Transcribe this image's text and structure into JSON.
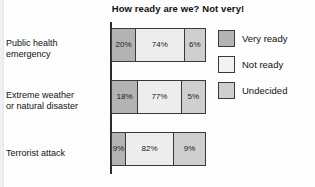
{
  "chart_data": {
    "type": "bar",
    "subtype": "stacked-horizontal-100pct",
    "title": "How ready are we? Not very!",
    "xlabel": "",
    "ylabel": "",
    "xlim": [
      0,
      100
    ],
    "grid": false,
    "legend_position": "right",
    "categories": [
      "Public health emergency",
      "Extreme weather or natural disaster",
      "Terrorist attack"
    ],
    "series": [
      {
        "name": "Very ready",
        "color": "#b3b3b3",
        "values": [
          20,
          74,
          6
        ]
      },
      {
        "name": "Not ready",
        "color": "#f2f2f2",
        "values": [
          18,
          77,
          5
        ]
      },
      {
        "name": "Undecided",
        "color": "#cfcfcf",
        "values": [
          9,
          82,
          9
        ]
      }
    ],
    "rows": [
      {
        "category": "Public health emergency",
        "category_line1": "Public health",
        "category_line2": "emergency",
        "segments": [
          {
            "series": "Very ready",
            "value": 20,
            "label": "20%",
            "width_pct": 26
          },
          {
            "series": "Not ready",
            "value": 74,
            "label": "74%",
            "width_pct": 52
          },
          {
            "series": "Undecided",
            "value": 6,
            "label": "6%",
            "width_pct": 22
          }
        ]
      },
      {
        "category": "Extreme weather or natural disaster",
        "category_line1": "Extreme weather",
        "category_line2": "or natural disaster",
        "segments": [
          {
            "series": "Very ready",
            "value": 18,
            "label": "18%",
            "width_pct": 28
          },
          {
            "series": "Not ready",
            "value": 77,
            "label": "77%",
            "width_pct": 47
          },
          {
            "series": "Undecided",
            "value": 5,
            "label": "5%",
            "width_pct": 25
          }
        ]
      },
      {
        "category": "Terrorist attack",
        "category_line1": "Terrorist attack",
        "category_line2": "",
        "segments": [
          {
            "series": "Very ready",
            "value": 9,
            "label": "9%",
            "width_pct": 15
          },
          {
            "series": "Not ready",
            "value": 82,
            "label": "82%",
            "width_pct": 52
          },
          {
            "series": "Undecided",
            "value": 9,
            "label": "9%",
            "width_pct": 33
          }
        ]
      }
    ],
    "legend": [
      {
        "label": "Very ready",
        "color": "#b3b3b3"
      },
      {
        "label": "Not ready",
        "color": "#f2f2f2"
      },
      {
        "label": "Undecided",
        "color": "#cfcfcf"
      }
    ]
  }
}
